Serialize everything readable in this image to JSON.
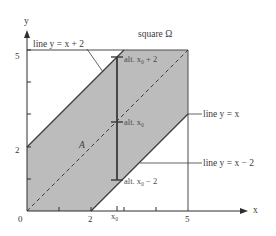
{
  "diagram": {
    "title_label": "square Ω",
    "region_label": "A",
    "axes": {
      "x_label": "x",
      "y_label": "y",
      "x_ticks": [
        "0",
        "2",
        "5"
      ],
      "y_ticks": [
        "2",
        "5"
      ],
      "x0_label": "x₀"
    },
    "lines": {
      "upper": "line y = x + 2",
      "middle": "line y = x",
      "lower": "line y = x − 2"
    },
    "altitudes": {
      "top": "alt. x₀ + 2",
      "mid": "alt. x₀",
      "bottom": "alt. x₀ − 2"
    },
    "colors": {
      "shaded_region": "#b9b9b9",
      "lines": "#3c3c3c",
      "axes": "#2e2e2e",
      "text": "#3a3a3a",
      "background": "#ffffff"
    },
    "geometry": {
      "origin_px": [
        27,
        211
      ],
      "unit_px": 32.2,
      "square_range": [
        0,
        5
      ],
      "band": "|y - x| <= 2",
      "x0_value": 3.05
    }
  }
}
